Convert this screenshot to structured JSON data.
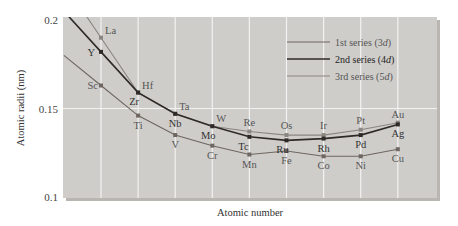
{
  "chart_data": {
    "type": "line",
    "title": "",
    "xlabel": "Atomic number",
    "ylabel": "Atomic radii (nm)",
    "ylim": [
      0.1,
      0.2
    ],
    "yticks": [
      "0.2",
      "0.15",
      "0.1"
    ],
    "grid": true,
    "legend_position": "upper right",
    "positions": [
      1,
      2,
      3,
      4,
      5,
      6,
      7,
      8,
      9
    ],
    "series": [
      {
        "name": "1st series (3d)",
        "legend_main": "1st series (3",
        "legend_d": "d",
        "legend_end": ")",
        "color": "#6e6660",
        "elements": [
          "Sc",
          "Ti",
          "V",
          "Cr",
          "Mn",
          "Fe",
          "Co",
          "Ni",
          "Cu"
        ],
        "values": [
          0.163,
          0.146,
          0.135,
          0.129,
          0.124,
          0.126,
          0.123,
          0.123,
          0.127
        ]
      },
      {
        "name": "2nd series (4d)",
        "legend_main": "2nd series (4",
        "legend_d": "d",
        "legend_end": ")",
        "color": "#2e2a28",
        "elements": [
          "Y",
          "Zr",
          "Nb",
          "Mo",
          "Tc",
          "Ru",
          "Rh",
          "Pd",
          "Ag"
        ],
        "values": [
          0.182,
          0.159,
          0.147,
          0.14,
          0.134,
          0.132,
          0.133,
          0.135,
          0.141
        ]
      },
      {
        "name": "3rd series (5d)",
        "legend_main": "3rd series (5",
        "legend_d": "d",
        "legend_end": ")",
        "color": "#8a8682",
        "elements": [
          "La",
          "Hf",
          "Ta",
          "W",
          "Re",
          "Os",
          "Ir",
          "Pt",
          "Au"
        ],
        "values": [
          0.19,
          0.159,
          0.147,
          0.14,
          0.137,
          0.135,
          0.135,
          0.138,
          0.142
        ]
      }
    ]
  },
  "colors": {
    "plot_background": "#cfcdca",
    "gridline": "#f2f2f0",
    "frame_shadow": "#b9b6b2"
  }
}
